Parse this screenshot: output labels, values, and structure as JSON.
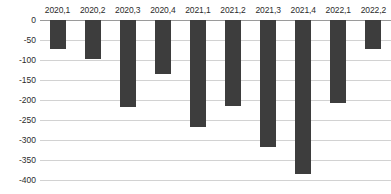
{
  "chart_data": {
    "type": "bar",
    "title": "",
    "subtitle": "",
    "xlabel": "",
    "ylabel": "",
    "categories": [
      "2020,1",
      "2020,2",
      "2020,3",
      "2020,4",
      "2021,1",
      "2021,2",
      "2021,3",
      "2021,4",
      "2022,1",
      "2022,2"
    ],
    "values": [
      -73,
      -97,
      -218,
      -135,
      -267,
      -216,
      -318,
      -385,
      -208,
      -72
    ],
    "ylim": [
      -400,
      0
    ],
    "yticks": [
      0,
      -50,
      -100,
      -150,
      -200,
      -250,
      -300,
      -350,
      -400
    ],
    "ytick_labels": [
      "0",
      "-50",
      "-100",
      "-150",
      "-200",
      "-250",
      "-300",
      "-350",
      "-400"
    ],
    "grid": true,
    "legend": false,
    "legend_position": "none",
    "series": [
      {
        "name": "",
        "values": [
          -73,
          -97,
          -218,
          -135,
          -267,
          -216,
          -318,
          -385,
          -208,
          -72
        ]
      }
    ]
  },
  "style": {
    "bar_color": "#3d3d3d",
    "gridline_color": "#d2d2d2",
    "zero_line_color": "#9a9a9a",
    "text_color": "#2b2b2b",
    "background": "#ffffff"
  }
}
